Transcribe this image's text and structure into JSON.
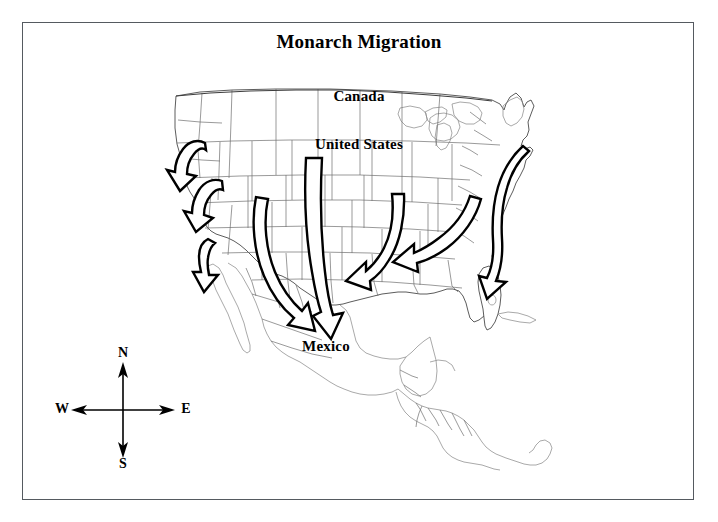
{
  "figure": {
    "title": "Monarch Migration",
    "frame_color": "#555a60",
    "background_color": "#ffffff"
  },
  "map": {
    "outline_color": "#4a4a4a",
    "border_color": "#6e6e6e",
    "arrow_fill": "#ffffff",
    "arrow_stroke": "#000000",
    "region_labels": [
      {
        "name": "canada",
        "text": "Canada"
      },
      {
        "name": "united-states",
        "text": "United States"
      },
      {
        "name": "mexico",
        "text": "Mexico"
      }
    ]
  },
  "compass": {
    "north": "N",
    "south": "S",
    "west": "W",
    "east": "E"
  },
  "migration_arrows": [
    {
      "id": "west-1",
      "label": "pacific-northwest-arrow",
      "from": "Washington / Oregon",
      "to": "Northern California",
      "direction": "southwest"
    },
    {
      "id": "west-2",
      "label": "northern-california-arrow",
      "from": "Oregon / Idaho",
      "to": "Central California",
      "direction": "southwest"
    },
    {
      "id": "west-3",
      "label": "southern-california-arrow",
      "from": "Central California",
      "to": "Southern California coast",
      "direction": "south"
    },
    {
      "id": "central-1",
      "label": "great-basin-to-mexico-arrow",
      "from": "Great Basin / Nevada",
      "to": "Northern Mexico",
      "direction": "south-southeast"
    },
    {
      "id": "central-2",
      "label": "great-plains-to-mexico-arrow",
      "from": "Northern Great Plains",
      "to": "Central Mexico",
      "direction": "south"
    },
    {
      "id": "midwest-1",
      "label": "midwest-to-gulf-arrow",
      "from": "Upper Midwest",
      "to": "Lower Mississippi Valley",
      "direction": "south-southwest"
    },
    {
      "id": "east-1",
      "label": "appalachian-to-gulf-arrow",
      "from": "Great Lakes / Ohio Valley",
      "to": "Gulf Coast",
      "direction": "southwest"
    },
    {
      "id": "east-2",
      "label": "atlantic-coast-to-florida-arrow",
      "from": "New England",
      "to": "Florida",
      "direction": "south"
    }
  ]
}
